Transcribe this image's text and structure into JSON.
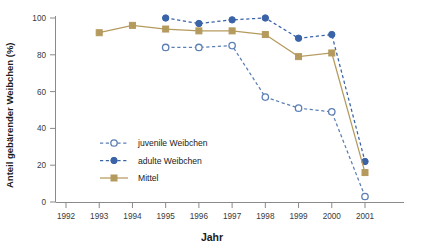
{
  "chart_data": {
    "type": "line",
    "title": "",
    "xlabel": "Jahr",
    "ylabel": "Anteil gebärender Weibchen (%)",
    "x": [
      1992,
      1993,
      1994,
      1995,
      1996,
      1997,
      1998,
      1999,
      2000,
      2001
    ],
    "xtick_labels": [
      "1992",
      "1993",
      "1994",
      "1995",
      "1996",
      "1997",
      "1998",
      "1999",
      "2000",
      "2001"
    ],
    "ytick_labels": [
      "0",
      "20",
      "40",
      "60",
      "80",
      "100"
    ],
    "yticks": [
      0,
      20,
      40,
      60,
      80,
      100
    ],
    "xlim": [
      1992,
      2001
    ],
    "ylim": [
      0,
      100
    ],
    "grid": false,
    "legend_position": "inside-lower-left",
    "series": [
      {
        "name": "juvenile Weibchen",
        "color": "#5b7fb5",
        "marker": "open-circle",
        "linestyle": "dashed",
        "x": [
          1995,
          1996,
          1997,
          1998,
          1999,
          2000,
          2001
        ],
        "values": [
          84,
          84,
          85,
          57,
          51,
          49,
          3
        ]
      },
      {
        "name": "adulte Weibchen",
        "color": "#3a63a8",
        "marker": "filled-circle",
        "linestyle": "dashed",
        "x": [
          1995,
          1996,
          1997,
          1998,
          1999,
          2000,
          2001
        ],
        "values": [
          100,
          97,
          99,
          100,
          89,
          91,
          22
        ]
      },
      {
        "name": "Mittel",
        "color": "#b59a5e",
        "marker": "filled-square",
        "linestyle": "solid",
        "x": [
          1993,
          1994,
          1995,
          1996,
          1997,
          1998,
          1999,
          2000,
          2001
        ],
        "values": [
          92,
          96,
          94,
          93,
          93,
          91,
          79,
          81,
          16
        ]
      }
    ]
  },
  "legend": {
    "items": [
      {
        "label": "juvenile Weibchen"
      },
      {
        "label": "adulte Weibchen"
      },
      {
        "label": "Mittel"
      }
    ]
  }
}
